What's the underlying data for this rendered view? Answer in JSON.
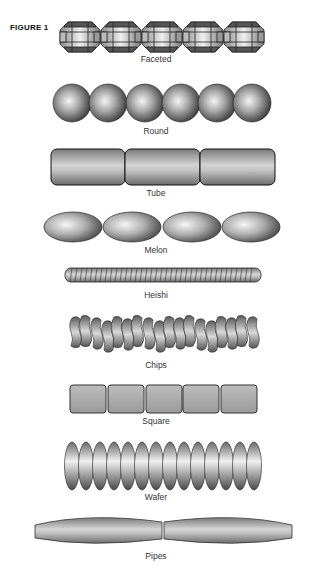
{
  "figure": {
    "label": "FIGURE 1"
  },
  "beads": [
    {
      "name": "Faceted",
      "count": 5
    },
    {
      "name": "Round",
      "count": 6
    },
    {
      "name": "Tube",
      "count": 3
    },
    {
      "name": "Melon",
      "count": 4
    },
    {
      "name": "Heishi",
      "count": 1
    },
    {
      "name": "Chips",
      "count": 18
    },
    {
      "name": "Square",
      "count": 5
    },
    {
      "name": "Wafer",
      "count": 14
    },
    {
      "name": "Pipes",
      "count": 2
    }
  ]
}
